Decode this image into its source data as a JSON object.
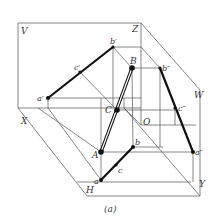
{
  "figure": {
    "caption": "(a)",
    "planes": {
      "V": "V",
      "H": "H",
      "W": "W"
    },
    "axes": {
      "X": "X",
      "Y": "Y",
      "Z": "Z",
      "O": "O"
    },
    "space_points": {
      "A": "A",
      "B": "B",
      "C": "C"
    },
    "front_projection": {
      "a": "a′",
      "b": "b′",
      "c": "c′"
    },
    "top_projection": {
      "a": "a",
      "b": "b",
      "c": "c"
    },
    "side_projection": {
      "a": "a″",
      "b": "b″",
      "c": "c″"
    }
  }
}
